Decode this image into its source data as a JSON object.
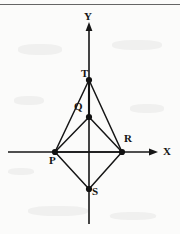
{
  "figure": {
    "background_color": "#fbfbfa",
    "stroke_color": "#161616",
    "axes": {
      "x_label": "X",
      "y_label": "Y",
      "origin": {
        "x": 89,
        "y": 152
      },
      "x_axis": {
        "start_x": 8,
        "end_x": 158,
        "y": 152,
        "arrow": "right"
      },
      "y_axis": {
        "x": 89,
        "start_y": 224,
        "end_y": 22,
        "arrow": "up"
      }
    },
    "points": [
      {
        "id": "T",
        "label": "T",
        "x": 89,
        "y": 80,
        "marker": "filled-dot",
        "label_dx": -8,
        "label_dy": -12
      },
      {
        "id": "Q",
        "label": "Q",
        "x": 89,
        "y": 117,
        "marker": "filled-dot",
        "label_dx": -15,
        "label_dy": -16
      },
      {
        "id": "P",
        "label": "P",
        "x": 55,
        "y": 152,
        "marker": "filled-dot",
        "label_dx": -6,
        "label_dy": 3
      },
      {
        "id": "R",
        "label": "R",
        "x": 122,
        "y": 152,
        "marker": "filled-dot",
        "label_dx": 2,
        "label_dy": -19
      },
      {
        "id": "S",
        "label": "S",
        "x": 89,
        "y": 189,
        "marker": "filled-dot",
        "label_dx": 3,
        "label_dy": -3
      }
    ],
    "segments": [
      {
        "from": "T",
        "to": "P"
      },
      {
        "from": "T",
        "to": "R"
      },
      {
        "from": "T",
        "to": "Q"
      },
      {
        "from": "Q",
        "to": "P"
      },
      {
        "from": "Q",
        "to": "R"
      },
      {
        "from": "P",
        "to": "S"
      },
      {
        "from": "R",
        "to": "S"
      },
      {
        "from": "P",
        "to": "R"
      }
    ]
  }
}
